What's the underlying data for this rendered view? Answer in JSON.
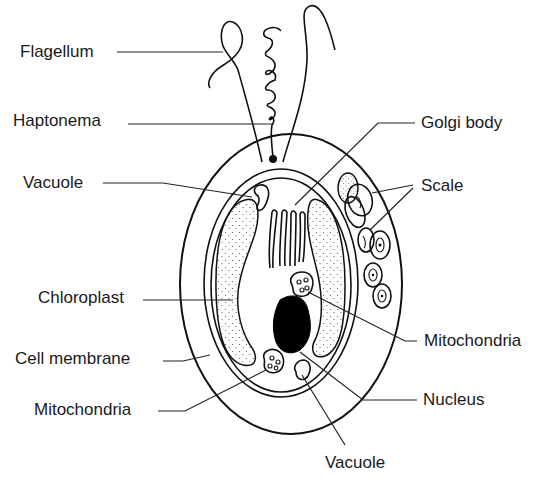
{
  "colors": {
    "ink": "#111111",
    "label": "#1a1a1a",
    "background": "#ffffff"
  },
  "labels": {
    "flagellum": "Flagellum",
    "haptonema": "Haptonema",
    "vacuole_top": "Vacuole",
    "chloroplast": "Chloroplast",
    "cell_membrane": "Cell membrane",
    "mitochondria_left": "Mitochondria",
    "golgi_body": "Golgi body",
    "scale": "Scale",
    "mitochondria_right": "Mitochondria",
    "nucleus": "Nucleus",
    "vacuole_bottom": "Vacuole"
  }
}
